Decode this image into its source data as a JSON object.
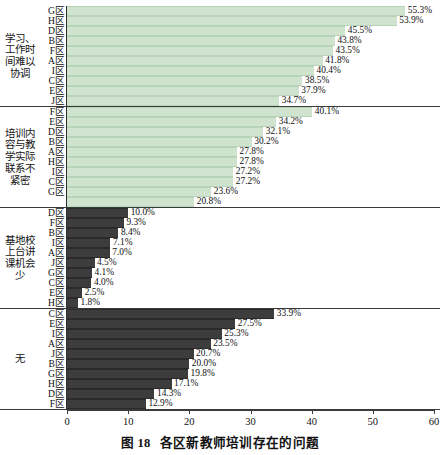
{
  "caption": {
    "figure_number": "图 18",
    "title": "各区新教师培训存在的问题"
  },
  "axis": {
    "ticks": [
      "0",
      "10",
      "20",
      "30",
      "40",
      "50",
      "60"
    ],
    "min": 0,
    "max": 60
  },
  "chart_data": {
    "type": "bar",
    "orientation": "horizontal",
    "xlabel": "",
    "ylabel": "",
    "xlim": [
      0,
      60
    ],
    "xticks": [
      0,
      10,
      20,
      30,
      40,
      50,
      60
    ],
    "grid": false,
    "legend": "none",
    "value_suffix": "%",
    "groups": [
      {
        "name": "学习、工作时间难以协调",
        "color": "#cfe3cf",
        "style": "light",
        "categories": [
          "G区",
          "H区",
          "D区",
          "B区",
          "F区",
          "A区",
          "I区",
          "C区",
          "E区",
          "J区"
        ],
        "values": [
          55.3,
          53.9,
          45.5,
          43.8,
          43.5,
          41.8,
          40.4,
          38.5,
          37.9,
          34.7
        ],
        "labels": [
          "55.3%",
          "53.9%",
          "45.5%",
          "43.8%",
          "43.5%",
          "41.8%",
          "40.4%",
          "38.5%",
          "37.9%",
          "34.7%"
        ]
      },
      {
        "name": "培训内容与教学实际联系不紧密",
        "color": "#cfe3cf",
        "style": "light",
        "categories": [
          "F区",
          "E区",
          "D区",
          "B区",
          "A区",
          "H区",
          "I区",
          "C区",
          "G区"
        ],
        "values": [
          40.1,
          34.2,
          32.1,
          30.2,
          27.8,
          27.8,
          27.2,
          27.2,
          23.6
        ],
        "labels": [
          "40.1%",
          "34.2%",
          "32.1%",
          "30.2%",
          "27.8%",
          "27.8%",
          "27.2%",
          "27.2%",
          "23.6%"
        ],
        "extra": {
          "label": "20.8%",
          "value": 20.8
        }
      },
      {
        "name": "基地校上台讲课机会少",
        "color": "#3d3d3d",
        "style": "dark",
        "categories": [
          "D区",
          "F区",
          "B区",
          "I区",
          "A区",
          "J区",
          "G区",
          "C区",
          "E区",
          "H区"
        ],
        "values": [
          10.0,
          9.3,
          8.4,
          7.1,
          7.0,
          4.5,
          4.1,
          4.0,
          2.5,
          1.8
        ],
        "labels": [
          "10.0%",
          "9.3%",
          "8.4%",
          "7.1%",
          "7.0%",
          "4.5%",
          "4.1%",
          "4.0%",
          "2.5%",
          "1.8%"
        ]
      },
      {
        "name": "无",
        "color": "#3d3d3d",
        "style": "dark",
        "categories": [
          "C区",
          "E区",
          "I区",
          "A区",
          "J区",
          "B区",
          "G区",
          "H区",
          "D区",
          "F区"
        ],
        "values": [
          33.9,
          27.5,
          25.3,
          23.5,
          20.7,
          20.0,
          19.8,
          17.1,
          14.3,
          12.9
        ],
        "labels": [
          "33.9%",
          "27.5%",
          "25.3%",
          "23.5%",
          "20.7%",
          "20.0%",
          "19.8%",
          "17.1%",
          "14.3%",
          "12.9%"
        ]
      }
    ]
  }
}
